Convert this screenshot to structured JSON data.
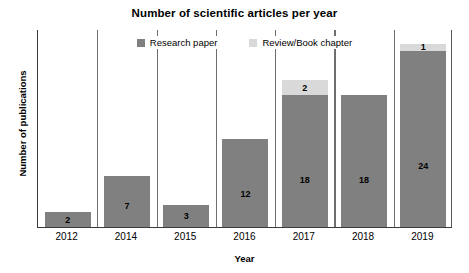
{
  "chart_data": {
    "type": "bar",
    "stacked": true,
    "title": "Number of scientific articles per year",
    "xlabel": "Year",
    "ylabel": "Number of publications",
    "categories": [
      "2012",
      "2014",
      "2015",
      "2016",
      "2017",
      "2018",
      "2019"
    ],
    "series": [
      {
        "name": "Research paper",
        "color": "#808080",
        "values": [
          2,
          7,
          3,
          12,
          18,
          18,
          24
        ]
      },
      {
        "name": "Review/Book chapter",
        "color": "#d9d9d9",
        "values": [
          0,
          0,
          0,
          0,
          2,
          0,
          1
        ]
      }
    ],
    "totals": [
      2,
      7,
      3,
      12,
      20,
      18,
      25
    ],
    "ylim": [
      0,
      27
    ],
    "grid": "vertical-category-separators",
    "y_tick_labels": [],
    "legend_position": "top-center",
    "data_labels": {
      "Research paper": [
        "2",
        "7",
        "3",
        "12",
        "18",
        "18",
        "24"
      ],
      "Review/Book chapter": [
        "",
        "",
        "",
        "",
        "2",
        "",
        "1"
      ]
    }
  },
  "legend": {
    "items": [
      {
        "label": "Research paper",
        "swatch": "dark-gray-square"
      },
      {
        "label": "Review/Book chapter",
        "swatch": "light-gray-square"
      }
    ]
  }
}
